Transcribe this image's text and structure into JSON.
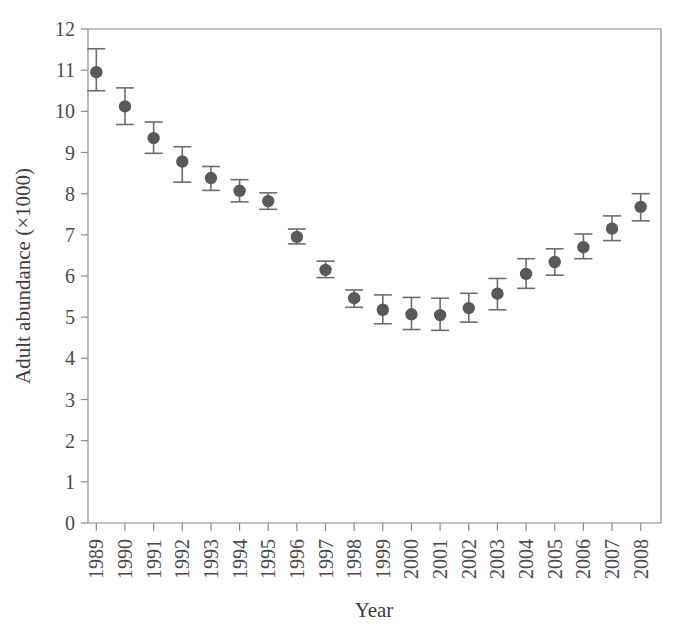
{
  "chart_data": {
    "type": "scatter",
    "title": "",
    "xlabel": "Year",
    "ylabel": "Adult abundance (×1000)",
    "categories": [
      "1989",
      "1990",
      "1991",
      "1992",
      "1993",
      "1994",
      "1995",
      "1996",
      "1997",
      "1998",
      "1999",
      "2000",
      "2001",
      "2002",
      "2003",
      "2004",
      "2005",
      "2006",
      "2007",
      "2008"
    ],
    "values": [
      10.95,
      10.12,
      9.35,
      8.78,
      8.38,
      8.07,
      7.82,
      6.95,
      6.15,
      5.46,
      5.18,
      5.07,
      5.05,
      5.22,
      5.57,
      6.05,
      6.34,
      6.7,
      7.15,
      7.68
    ],
    "error_low": [
      10.5,
      9.68,
      8.98,
      8.28,
      8.08,
      7.8,
      7.62,
      6.78,
      5.96,
      5.24,
      4.84,
      4.7,
      4.68,
      4.88,
      5.18,
      5.7,
      6.02,
      6.42,
      6.86,
      7.34
    ],
    "error_high": [
      11.52,
      10.57,
      9.74,
      9.14,
      8.66,
      8.34,
      8.02,
      7.14,
      6.36,
      5.66,
      5.54,
      5.48,
      5.46,
      5.58,
      5.94,
      6.42,
      6.66,
      7.02,
      7.46,
      8.0
    ],
    "error_type": "confidence-interval",
    "ylim": [
      0,
      12
    ],
    "yticks": [
      0,
      1,
      2,
      3,
      4,
      5,
      6,
      7,
      8,
      9,
      10,
      11,
      12
    ],
    "ytick_labels": [
      "0",
      "1",
      "2",
      "3",
      "4",
      "5",
      "6",
      "7",
      "8",
      "9",
      "10",
      "11",
      "12"
    ],
    "grid": false,
    "legend": "none",
    "marker_color": "#595959",
    "errorbar_color": "#6d6d6d",
    "axis_color": "#8a8a8a",
    "background": "#ffffff"
  }
}
